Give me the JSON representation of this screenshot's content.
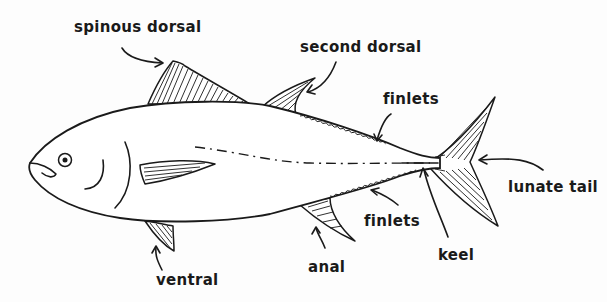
{
  "diagram": {
    "colors": {
      "ink": "#1a1a1a",
      "background": "#fdfdfd"
    },
    "labels": {
      "spinous_dorsal": "spinous dorsal",
      "second_dorsal": "second dorsal",
      "finlets_top": "finlets",
      "finlets_bottom": "finlets",
      "lunate_tail": "lunate tail",
      "keel": "keel",
      "anal": "anal",
      "ventral": "ventral"
    }
  }
}
